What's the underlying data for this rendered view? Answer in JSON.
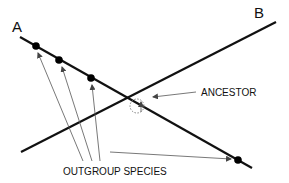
{
  "diagram": {
    "labels": {
      "line_a": "A",
      "line_b": "B",
      "ancestor": "ANCESTOR",
      "outgroup": "OUTGROUP SPECIES"
    },
    "colors": {
      "line": "#111111",
      "arrow": "#555555",
      "background": "#ffffff"
    },
    "lines": [
      {
        "name": "A",
        "x1": 20,
        "y1": 37,
        "x2": 252,
        "y2": 168
      },
      {
        "name": "B",
        "x1": 21,
        "y1": 152,
        "x2": 276,
        "y2": 22
      }
    ],
    "species_points": [
      {
        "x": 36,
        "y": 46
      },
      {
        "x": 59,
        "y": 60
      },
      {
        "x": 91,
        "y": 78
      },
      {
        "x": 238,
        "y": 160
      }
    ],
    "ancestor_point": {
      "x": 137,
      "y": 106,
      "r": 7
    }
  }
}
